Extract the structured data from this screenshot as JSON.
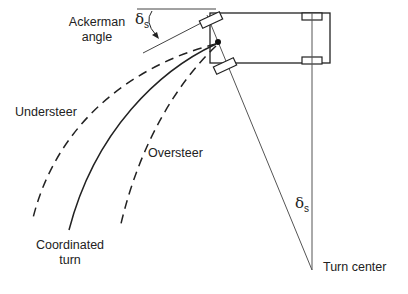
{
  "diagram": {
    "labels": {
      "ackerman_line1": "Ackerman",
      "ackerman_line2": "angle",
      "delta_symbol": "δ",
      "delta_sub": "s",
      "understeer": "Understeer",
      "oversteer": "Oversteer",
      "coordinated_line1": "Coordinated",
      "coordinated_line2": "turn",
      "turn_center": "Turn center"
    },
    "colors": {
      "stroke": "#222222",
      "thin_stroke": "#555555",
      "background": "#ffffff"
    },
    "geometry": {
      "vehicle_body": {
        "x": 210,
        "y": 13,
        "width": 120,
        "height": 50
      },
      "rear_axle_x": 312,
      "turn_center": {
        "x": 312,
        "y": 270
      },
      "cg_point": {
        "x": 218,
        "y": 42
      }
    },
    "paths": [
      {
        "name": "understeer",
        "style": "dashed"
      },
      {
        "name": "coordinated-turn",
        "style": "solid"
      },
      {
        "name": "oversteer",
        "style": "dashed"
      }
    ]
  }
}
